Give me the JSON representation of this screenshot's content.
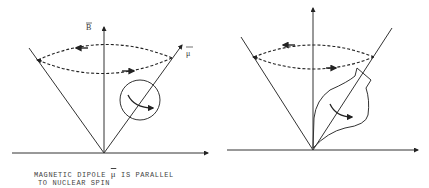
{
  "figure": {
    "left_panel": {
      "axis_label": "B",
      "dipole_label": "μ",
      "caption_line1_prefix": "MAGNETIC DIPOLE",
      "caption_symbol": "μ",
      "caption_line1_suffix": "IS PARALLEL",
      "caption_line2": "TO NUCLEAR SPIN"
    },
    "right_panel": {}
  },
  "colors": {
    "line": "#333333",
    "background": "#ffffff"
  }
}
